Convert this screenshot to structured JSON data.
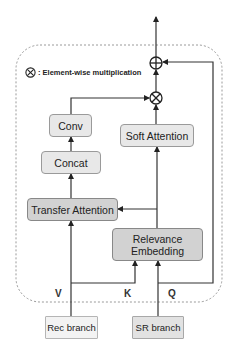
{
  "legend": {
    "symbol": "⊗",
    "text": ": Element-wise multiplication"
  },
  "nodes": {
    "conv": "Conv",
    "concat": "Concat",
    "transfer_attention": "Transfer Attention",
    "soft_attention": "Soft Attention",
    "relevance_embedding_line1": "Relevance",
    "relevance_embedding_line2": "Embedding",
    "rec_branch": "Rec branch",
    "sr_branch": "SR branch"
  },
  "operators": {
    "add": "⊕",
    "multiply": "⊗"
  },
  "inputs": {
    "v": "V",
    "k": "K",
    "q": "Q"
  },
  "colors": {
    "light_fill": "#e8e8e8",
    "dark_fill": "#d2d2d2",
    "rec_fill": "#f3f3f3",
    "sr_fill": "#e2e2e2",
    "line": "#333333",
    "dashed_border": "#999999"
  }
}
